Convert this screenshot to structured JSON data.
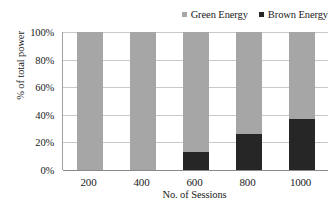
{
  "chart_data": {
    "type": "bar",
    "subtype": "stacked-100-percent",
    "title": "",
    "xlabel": "No. of Sessions",
    "ylabel": "% of total power",
    "categories": [
      "200",
      "400",
      "600",
      "800",
      "1000"
    ],
    "series": [
      {
        "name": "Green Energy",
        "color": "#a6a6a6",
        "values": [
          100,
          100,
          87,
          74,
          63
        ]
      },
      {
        "name": "Brown Energy",
        "color": "#262626",
        "values": [
          0,
          0,
          13,
          26,
          37
        ]
      }
    ],
    "ylim": [
      0,
      100
    ],
    "ytick_labels": [
      "100%",
      "80%",
      "60%",
      "40%",
      "20%",
      "0%"
    ],
    "ytick_values": [
      100,
      80,
      60,
      40,
      20,
      0
    ],
    "grid": true,
    "legend_position": "top-right"
  },
  "legend": {
    "entries": [
      {
        "label": "Green Energy",
        "color": "#a6a6a6"
      },
      {
        "label": "Brown Energy",
        "color": "#262626"
      }
    ]
  },
  "axes": {
    "y_title": "% of total power",
    "x_title": "No. of Sessions"
  },
  "colors": {
    "green_energy": "#a6a6a6",
    "brown_energy": "#262626",
    "gridline": "#c9c9c9",
    "axis": "#8a8a8a",
    "background": "#ffffff"
  }
}
